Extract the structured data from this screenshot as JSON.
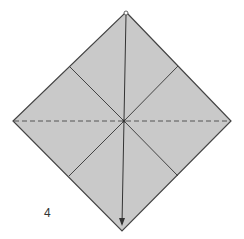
{
  "diagram": {
    "type": "origami-fold-step",
    "step_number": "4",
    "colors": {
      "paper_fill": "#c9c9c9",
      "edge_stroke": "#444444",
      "background": "#ffffff"
    },
    "shapes": {
      "square_diamond": {
        "top": [
          126,
          12
        ],
        "right": [
          231,
          121
        ],
        "bottom": [
          122,
          231
        ],
        "left": [
          13,
          121
        ]
      },
      "center": [
        124,
        121
      ],
      "crease_lines": [
        {
          "from": [
            69,
            66
          ],
          "to": [
            124,
            121
          ]
        },
        {
          "from": [
            178,
            66
          ],
          "to": [
            124,
            121
          ]
        },
        {
          "from": [
            69,
            176
          ],
          "to": [
            124,
            121
          ]
        },
        {
          "from": [
            178,
            176
          ],
          "to": [
            124,
            121
          ]
        }
      ],
      "valley_fold_dashed": {
        "from": [
          14,
          121
        ],
        "to": [
          230,
          121
        ]
      },
      "fold_arrow": {
        "from": [
          126,
          14
        ],
        "to": [
          122,
          226
        ],
        "direction": "down"
      }
    }
  }
}
